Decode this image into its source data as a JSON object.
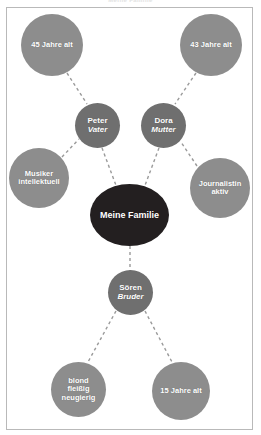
{
  "page": {
    "running_head": "Meine Familie",
    "frame_color": "#b9b9b9",
    "background": "#ffffff"
  },
  "palette": {
    "center_node": "#231f20",
    "primary_node": "#6f6f6f",
    "leaf_node": "#8d8d8d",
    "link": "#9a9a9a",
    "node_text": "#ffffff"
  },
  "mindmap": {
    "center": {
      "id": "center",
      "label": "Meine Familie",
      "lines": [
        "Meine Familie"
      ]
    },
    "nodes": [
      {
        "id": "father",
        "name": "Peter",
        "role": "Vater",
        "lines": [
          "Peter",
          "Vater"
        ]
      },
      {
        "id": "mother",
        "name": "Dora",
        "role": "Mutter",
        "lines": [
          "Dora",
          "Mutter"
        ]
      },
      {
        "id": "brother",
        "name": "Sören",
        "role": "Bruder",
        "lines": [
          "Sören",
          "Bruder"
        ]
      }
    ],
    "leaves": [
      {
        "id": "father-age",
        "parent": "father",
        "lines": [
          "45 Jahre alt"
        ]
      },
      {
        "id": "mother-age",
        "parent": "mother",
        "lines": [
          "43 Jahre alt"
        ]
      },
      {
        "id": "father-traits",
        "parent": "father",
        "lines": [
          "Musiker",
          "intellektuell"
        ]
      },
      {
        "id": "mother-traits",
        "parent": "mother",
        "lines": [
          "Journalistin",
          "aktiv"
        ]
      },
      {
        "id": "brother-traits",
        "parent": "brother",
        "lines": [
          "blond",
          "fleißig",
          "neugierig"
        ]
      },
      {
        "id": "brother-age",
        "parent": "brother",
        "lines": [
          "15 Jahre alt"
        ]
      }
    ],
    "links": [
      {
        "from": "father-age",
        "to": "father"
      },
      {
        "from": "mother-age",
        "to": "mother"
      },
      {
        "from": "father-traits",
        "to": "father"
      },
      {
        "from": "mother-traits",
        "to": "mother"
      },
      {
        "from": "father",
        "to": "center"
      },
      {
        "from": "mother",
        "to": "center"
      },
      {
        "from": "center",
        "to": "brother"
      },
      {
        "from": "brother",
        "to": "brother-traits"
      },
      {
        "from": "brother",
        "to": "brother-age"
      }
    ]
  }
}
